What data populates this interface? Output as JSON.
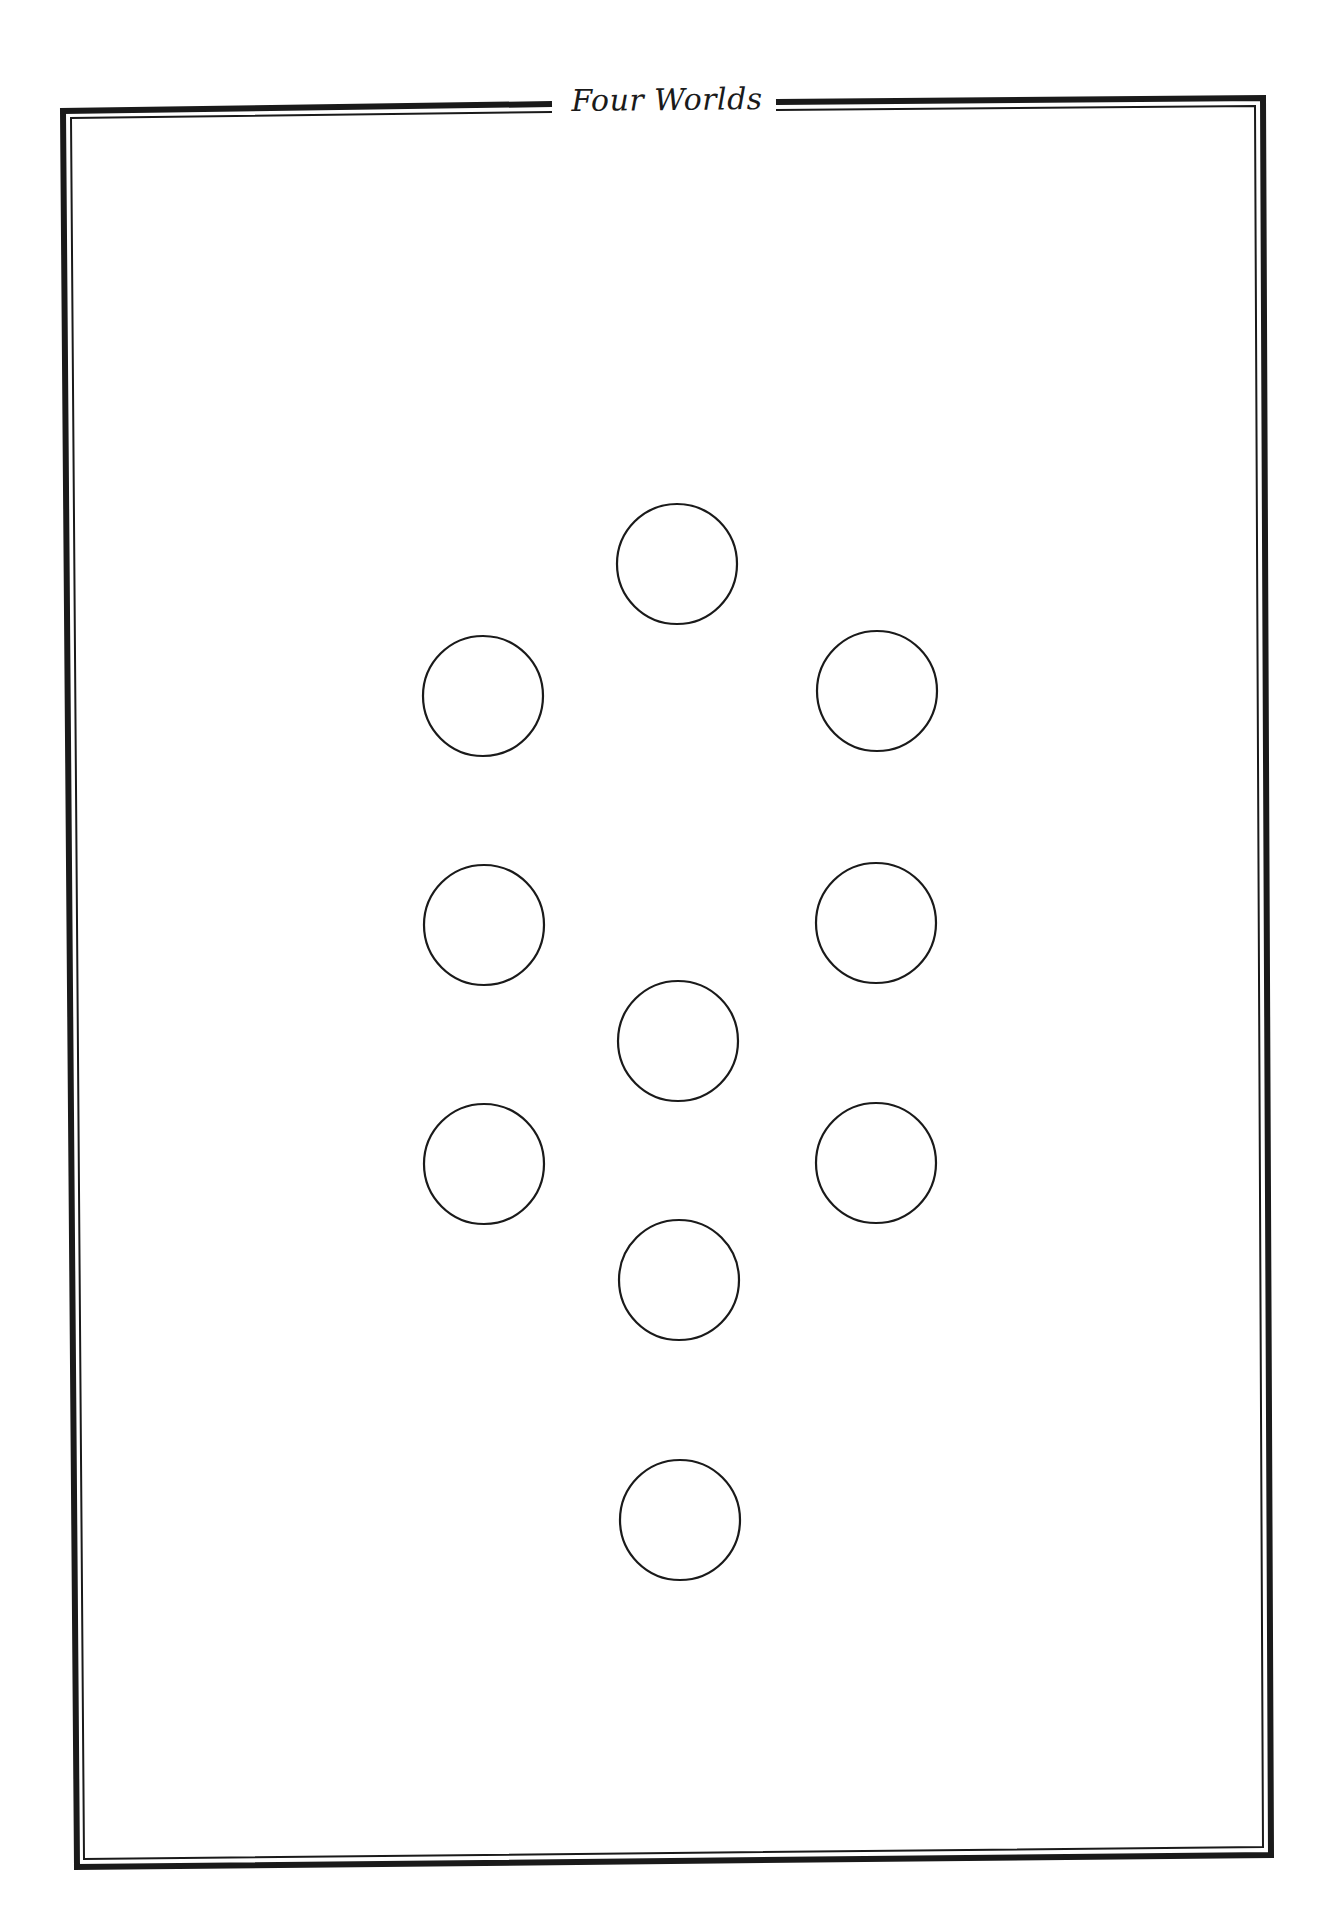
{
  "page": {
    "title": "Four Worlds",
    "background": "#ffffff",
    "ink_color": "#1a1a1a"
  },
  "frame": {
    "style": "double-line border (thick outer, thin inner) with gap at top for title",
    "corners": {
      "top_left": [
        60,
        110
      ],
      "top_right": [
        1266,
        95
      ],
      "bottom_right": [
        1274,
        1858
      ],
      "bottom_left": [
        74,
        1870
      ]
    },
    "title_gap": {
      "left_end_x": 552,
      "right_start_x": 776
    }
  },
  "diagram": {
    "circle_radius": 60,
    "circles": [
      {
        "id": "c1",
        "column": "center",
        "cx": 677,
        "cy": 564
      },
      {
        "id": "c2",
        "column": "left",
        "cx": 483,
        "cy": 696
      },
      {
        "id": "c3",
        "column": "right",
        "cx": 877,
        "cy": 691
      },
      {
        "id": "c4",
        "column": "left",
        "cx": 484,
        "cy": 925
      },
      {
        "id": "c5",
        "column": "right",
        "cx": 876,
        "cy": 923
      },
      {
        "id": "c6",
        "column": "center",
        "cx": 678,
        "cy": 1041
      },
      {
        "id": "c7",
        "column": "left",
        "cx": 484,
        "cy": 1164
      },
      {
        "id": "c8",
        "column": "right",
        "cx": 876,
        "cy": 1163
      },
      {
        "id": "c9",
        "column": "center",
        "cx": 679,
        "cy": 1280
      },
      {
        "id": "c10",
        "column": "center",
        "cx": 680,
        "cy": 1520
      }
    ]
  }
}
